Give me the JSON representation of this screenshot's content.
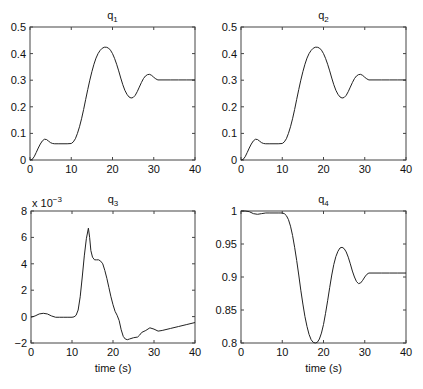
{
  "figure": {
    "background": "#ffffff",
    "line_color": "#222222"
  },
  "chart_data": [
    {
      "type": "line",
      "title": "q",
      "title_subscript": "1",
      "xlabel": "",
      "ylabel": "",
      "xlim": [
        0,
        40
      ],
      "ylim": [
        0,
        0.5
      ],
      "xticks": [
        0,
        10,
        20,
        30,
        40
      ],
      "xtick_labels": [
        "0",
        "10",
        "20",
        "30",
        "40"
      ],
      "yticks": [
        0,
        0.1,
        0.2,
        0.3,
        0.4,
        0.5
      ],
      "ytick_labels": [
        "0",
        "0.1",
        "0.2",
        "0.3",
        "0.4",
        "0.5"
      ],
      "exponent_label": "",
      "grid": false,
      "series": [
        {
          "name": "q1",
          "x": [
            0,
            0.5,
            1,
            1.5,
            2,
            2.5,
            3,
            3.5,
            4,
            4.5,
            5,
            5.5,
            6,
            7,
            8,
            9,
            10,
            10.5,
            11,
            11.5,
            12,
            12.5,
            13,
            13.5,
            14,
            14.5,
            15,
            15.5,
            16,
            16.5,
            17,
            17.5,
            18,
            18.5,
            19,
            19.5,
            20,
            20.5,
            21,
            21.5,
            22,
            22.5,
            23,
            23.5,
            24,
            24.5,
            25,
            25.5,
            26,
            26.5,
            27,
            27.5,
            28,
            28.5,
            29,
            29.5,
            30,
            30.5,
            31,
            32,
            34,
            36,
            38,
            40
          ],
          "y": [
            0,
            0.002,
            0.012,
            0.028,
            0.045,
            0.06,
            0.072,
            0.078,
            0.077,
            0.071,
            0.065,
            0.062,
            0.061,
            0.061,
            0.061,
            0.061,
            0.062,
            0.068,
            0.08,
            0.1,
            0.125,
            0.155,
            0.19,
            0.228,
            0.265,
            0.3,
            0.332,
            0.36,
            0.383,
            0.4,
            0.412,
            0.42,
            0.424,
            0.424,
            0.421,
            0.413,
            0.4,
            0.382,
            0.36,
            0.335,
            0.308,
            0.283,
            0.262,
            0.247,
            0.237,
            0.233,
            0.235,
            0.243,
            0.257,
            0.274,
            0.291,
            0.306,
            0.316,
            0.321,
            0.322,
            0.318,
            0.311,
            0.305,
            0.301,
            0.301,
            0.301,
            0.301,
            0.301,
            0.301
          ]
        }
      ]
    },
    {
      "type": "line",
      "title": "q",
      "title_subscript": "2",
      "xlabel": "",
      "ylabel": "",
      "xlim": [
        0,
        40
      ],
      "ylim": [
        0,
        0.5
      ],
      "xticks": [
        0,
        10,
        20,
        30,
        40
      ],
      "xtick_labels": [
        "0",
        "10",
        "20",
        "30",
        "40"
      ],
      "yticks": [
        0,
        0.1,
        0.2,
        0.3,
        0.4,
        0.5
      ],
      "ytick_labels": [
        "0",
        "0.1",
        "0.2",
        "0.3",
        "0.4",
        "0.5"
      ],
      "exponent_label": "",
      "grid": false,
      "series": [
        {
          "name": "q2",
          "x": [
            0,
            0.5,
            1,
            1.5,
            2,
            2.5,
            3,
            3.5,
            4,
            4.5,
            5,
            5.5,
            6,
            7,
            8,
            9,
            10,
            10.5,
            11,
            11.5,
            12,
            12.5,
            13,
            13.5,
            14,
            14.5,
            15,
            15.5,
            16,
            16.5,
            17,
            17.5,
            18,
            18.5,
            19,
            19.5,
            20,
            20.5,
            21,
            21.5,
            22,
            22.5,
            23,
            23.5,
            24,
            24.5,
            25,
            25.5,
            26,
            26.5,
            27,
            27.5,
            28,
            28.5,
            29,
            29.5,
            30,
            30.5,
            31,
            32,
            34,
            36,
            38,
            40
          ],
          "y": [
            0,
            0.002,
            0.012,
            0.028,
            0.045,
            0.06,
            0.072,
            0.078,
            0.077,
            0.071,
            0.065,
            0.062,
            0.061,
            0.061,
            0.061,
            0.061,
            0.062,
            0.068,
            0.08,
            0.1,
            0.125,
            0.155,
            0.19,
            0.228,
            0.265,
            0.3,
            0.332,
            0.36,
            0.383,
            0.4,
            0.412,
            0.42,
            0.424,
            0.424,
            0.421,
            0.413,
            0.4,
            0.382,
            0.36,
            0.335,
            0.308,
            0.283,
            0.262,
            0.247,
            0.237,
            0.233,
            0.235,
            0.243,
            0.257,
            0.274,
            0.291,
            0.306,
            0.316,
            0.321,
            0.322,
            0.318,
            0.311,
            0.305,
            0.301,
            0.301,
            0.301,
            0.301,
            0.301,
            0.301
          ]
        }
      ]
    },
    {
      "type": "line",
      "title": "q",
      "title_subscript": "3",
      "xlabel": "time (s)",
      "ylabel": "",
      "xlim": [
        0,
        40
      ],
      "ylim": [
        -2,
        8
      ],
      "y_scale_factor": "x 10^-3",
      "xticks": [
        0,
        10,
        20,
        30,
        40
      ],
      "xtick_labels": [
        "0",
        "10",
        "20",
        "30",
        "40"
      ],
      "yticks": [
        -2,
        0,
        2,
        4,
        6,
        8
      ],
      "ytick_labels": [
        "-2",
        "0",
        "2",
        "4",
        "6",
        "8"
      ],
      "exponent_label": "x 10",
      "exponent_power": "-3",
      "grid": false,
      "series": [
        {
          "name": "q3",
          "x": [
            0,
            1,
            2,
            3,
            4,
            5,
            6,
            7,
            8,
            9,
            10,
            10.5,
            11,
            11.5,
            12,
            12.5,
            13,
            13.5,
            14,
            14.3,
            14.6,
            15,
            15.5,
            16,
            16.5,
            17,
            17.5,
            18,
            18.5,
            19,
            19.5,
            20,
            20.5,
            21,
            21.5,
            22,
            22.5,
            23,
            23.5,
            24,
            25,
            26,
            26.5,
            27,
            28,
            29,
            30,
            31,
            32,
            34,
            36,
            38,
            40
          ],
          "y": [
            -0.05,
            0.05,
            0.2,
            0.25,
            0.2,
            0.05,
            -0.05,
            -0.05,
            -0.05,
            -0.05,
            -0.05,
            -0.02,
            0.1,
            0.5,
            1.5,
            3.0,
            4.6,
            5.9,
            6.7,
            6.0,
            5.0,
            4.5,
            4.3,
            4.3,
            4.3,
            4.2,
            4.0,
            3.5,
            2.9,
            2.2,
            1.5,
            0.9,
            0.4,
            0.1,
            -0.3,
            -1.0,
            -1.5,
            -1.7,
            -1.75,
            -1.7,
            -1.6,
            -1.55,
            -1.4,
            -1.2,
            -1.05,
            -0.85,
            -0.95,
            -1.1,
            -1.05,
            -0.9,
            -0.75,
            -0.6,
            -0.45
          ]
        }
      ]
    },
    {
      "type": "line",
      "title": "q",
      "title_subscript": "4",
      "xlabel": "time (s)",
      "ylabel": "",
      "xlim": [
        0,
        40
      ],
      "ylim": [
        0.8,
        1.0
      ],
      "xticks": [
        0,
        10,
        20,
        30,
        40
      ],
      "xtick_labels": [
        "0",
        "10",
        "20",
        "30",
        "40"
      ],
      "yticks": [
        0.8,
        0.85,
        0.9,
        0.95,
        1.0
      ],
      "ytick_labels": [
        "0.8",
        "0.85",
        "0.9",
        "0.95",
        "1"
      ],
      "exponent_label": "",
      "grid": false,
      "series": [
        {
          "name": "q4",
          "x": [
            0,
            1,
            2,
            3,
            4,
            5,
            6,
            7,
            8,
            9,
            10,
            10.5,
            11,
            11.5,
            12,
            12.5,
            13,
            13.5,
            14,
            14.5,
            15,
            15.5,
            16,
            16.5,
            17,
            17.5,
            18,
            18.5,
            19,
            19.5,
            20,
            20.5,
            21,
            21.5,
            22,
            22.5,
            23,
            23.5,
            24,
            24.5,
            25,
            25.5,
            26,
            26.5,
            27,
            27.5,
            28,
            28.5,
            29,
            29.5,
            30,
            30.5,
            31,
            32,
            34,
            36,
            38,
            40
          ],
          "y": [
            1.0,
            1.0,
            0.999,
            0.996,
            0.995,
            0.996,
            0.997,
            0.997,
            0.997,
            0.997,
            0.997,
            0.996,
            0.993,
            0.987,
            0.977,
            0.963,
            0.945,
            0.925,
            0.903,
            0.88,
            0.859,
            0.84,
            0.825,
            0.813,
            0.805,
            0.801,
            0.8,
            0.801,
            0.806,
            0.815,
            0.828,
            0.845,
            0.864,
            0.884,
            0.903,
            0.919,
            0.931,
            0.939,
            0.944,
            0.945,
            0.943,
            0.938,
            0.93,
            0.92,
            0.909,
            0.9,
            0.893,
            0.89,
            0.891,
            0.895,
            0.9,
            0.904,
            0.906,
            0.906,
            0.906,
            0.906,
            0.906,
            0.906
          ]
        }
      ]
    }
  ]
}
